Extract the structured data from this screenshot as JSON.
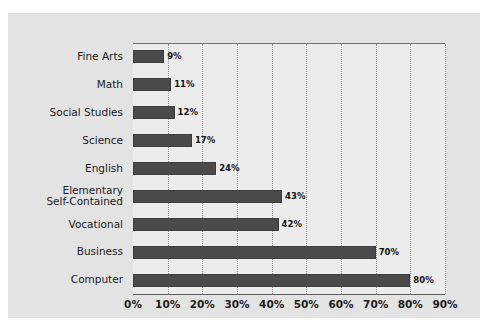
{
  "chart_data": {
    "type": "bar",
    "orientation": "horizontal",
    "title": "",
    "subtitle": "",
    "xlabel": "",
    "ylabel": "",
    "xlim": [
      0,
      90
    ],
    "ylim": null,
    "grid": true,
    "legend": null,
    "legend_position": "none",
    "categories": [
      "Fine Arts",
      "Math",
      "Social Studies",
      "Science",
      "English",
      "Elementary\nSelf-Contained",
      "Vocational",
      "Business",
      "Computer"
    ],
    "values": [
      9,
      11,
      12,
      17,
      24,
      43,
      42,
      70,
      80
    ],
    "value_labels": [
      "9%",
      "11%",
      "12%",
      "17%",
      "24%",
      "43%",
      "42%",
      "70%",
      "80%"
    ],
    "xticks": [
      0,
      10,
      20,
      30,
      40,
      50,
      60,
      70,
      80,
      90
    ],
    "xtick_labels": [
      "0%",
      "10%",
      "20%",
      "30%",
      "40%",
      "50%",
      "60%",
      "70%",
      "80%",
      "90%"
    ],
    "bar_color": "#4a4a4a",
    "bar_edge_color": "#3c3c3c",
    "plot_background": "#ececec",
    "figure_background": "#e3e3e3",
    "gridline_color": "#9a9a9a",
    "axis_color": "#5a5a5a",
    "text_color": "#1b1b1b"
  }
}
